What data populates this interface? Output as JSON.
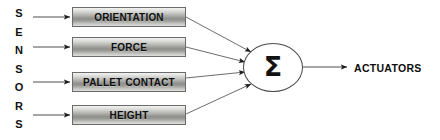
{
  "diagram": {
    "background_color": "#ffffff",
    "line_color": "#3a3a3a",
    "box_border_color": "#6b6b6b",
    "text_color": "#0d0d0d",
    "sensors_group": {
      "label_text": "SENSORS",
      "letters": [
        "S",
        "E",
        "N",
        "S",
        "O",
        "R",
        "S"
      ]
    },
    "sensor_boxes": [
      {
        "id": "orientation",
        "label": "ORIENTATION"
      },
      {
        "id": "force",
        "label": "FORCE"
      },
      {
        "id": "pallet-contact",
        "label": "PALLET CONTACT"
      },
      {
        "id": "height",
        "label": "HEIGHT"
      }
    ],
    "summation_node": {
      "symbol": "Σ",
      "name": "summation-node"
    },
    "output": {
      "label": "ACTUATORS"
    },
    "icons": {
      "arrow_right": "arrow-right-icon",
      "sigma": "sigma-icon"
    }
  }
}
